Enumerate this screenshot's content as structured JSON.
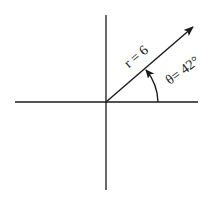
{
  "diagram": {
    "title": "",
    "vector_label": "r = 6",
    "angle_label": "θ= 42°",
    "radius": 6,
    "angle_deg": 42,
    "colors": {
      "line": "#1a1a1a",
      "background": "#ffffff"
    }
  }
}
